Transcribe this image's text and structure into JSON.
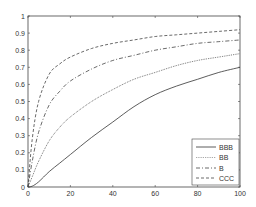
{
  "chart_data": {
    "type": "line",
    "title": "",
    "xlabel": "",
    "ylabel": "",
    "xlim": [
      0,
      100
    ],
    "ylim": [
      0,
      1
    ],
    "grid": false,
    "legend_position": "lower right",
    "x_ticks": [
      0,
      20,
      40,
      60,
      80,
      100
    ],
    "y_ticks": [
      0,
      0.1,
      0.2,
      0.3,
      0.4,
      0.5,
      0.6,
      0.7,
      0.8,
      0.9,
      1
    ],
    "x_tick_labels": [
      "0",
      "20",
      "40",
      "60",
      "80",
      "100"
    ],
    "y_tick_labels": [
      "0",
      "0.1",
      "0.2",
      "0.3",
      "0.4",
      "0.5",
      "0.6",
      "0.7",
      "0.8",
      "0.9",
      "1"
    ],
    "x": [
      0,
      2,
      5,
      10,
      15,
      20,
      30,
      40,
      50,
      60,
      70,
      80,
      90,
      100
    ],
    "series": [
      {
        "name": "BBB",
        "line_style": "solid",
        "color": "#333333",
        "values": [
          0,
          0.005,
          0.03,
          0.09,
          0.14,
          0.19,
          0.29,
          0.38,
          0.47,
          0.54,
          0.59,
          0.63,
          0.67,
          0.7
        ]
      },
      {
        "name": "BB",
        "line_style": "dotted",
        "color": "#555555",
        "values": [
          0,
          0.06,
          0.15,
          0.27,
          0.35,
          0.41,
          0.5,
          0.57,
          0.63,
          0.67,
          0.71,
          0.74,
          0.76,
          0.78
        ]
      },
      {
        "name": "B",
        "line_style": "dashdot",
        "color": "#444444",
        "values": [
          0,
          0.15,
          0.32,
          0.48,
          0.56,
          0.62,
          0.69,
          0.74,
          0.77,
          0.8,
          0.82,
          0.84,
          0.85,
          0.86
        ]
      },
      {
        "name": "CCC",
        "line_style": "dashed",
        "color": "#444444",
        "values": [
          0,
          0.28,
          0.5,
          0.66,
          0.72,
          0.76,
          0.81,
          0.84,
          0.86,
          0.88,
          0.89,
          0.9,
          0.91,
          0.92
        ]
      }
    ]
  },
  "legend": {
    "items": [
      {
        "label": "BBB"
      },
      {
        "label": "BB"
      },
      {
        "label": "B"
      },
      {
        "label": "CCC"
      }
    ]
  },
  "axes": {
    "x_tick_labels": [
      "0",
      "20",
      "40",
      "60",
      "80",
      "100"
    ],
    "y_tick_labels": [
      "0",
      "0.1",
      "0.2",
      "0.3",
      "0.4",
      "0.5",
      "0.6",
      "0.7",
      "0.8",
      "0.9",
      "1"
    ]
  }
}
